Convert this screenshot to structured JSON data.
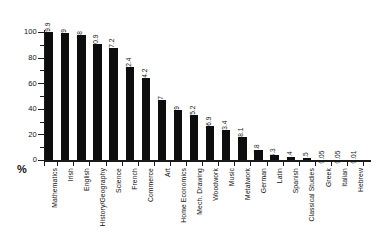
{
  "chart_data": {
    "type": "bar",
    "title": "",
    "subtitle": "",
    "xlabel": "",
    "ylabel": "%",
    "ylim": [
      0,
      100
    ],
    "ytick_values": [
      0,
      20,
      40,
      60,
      80,
      100
    ],
    "ytick_labels": [
      "0",
      "20",
      "40",
      "60",
      "80",
      "100"
    ],
    "yminor_values": [
      10,
      30,
      50,
      70,
      90
    ],
    "grid": false,
    "legend": null,
    "orientation": "vertical",
    "bar_color": "#0d0d0d",
    "background_color": "#ffffff",
    "axis_color": "#1a1a1a",
    "categories": [
      "Mathematics",
      "Irish",
      "English",
      "History/Geography",
      "Science",
      "French",
      "Commerce",
      "Art",
      "Home Economics",
      "Mech. Drawing",
      "Woodwork",
      "Music",
      "Metalwork",
      "German",
      "Latin",
      "Spanish",
      "Classical Studies",
      "Greek",
      "Italian",
      "Hebrew"
    ],
    "values": [
      99.9,
      99,
      98,
      90.9,
      87.2,
      72.4,
      64.2,
      47,
      39,
      35.2,
      26.9,
      23.4,
      18.1,
      7.8,
      4.3,
      2.4,
      1.5,
      0.05,
      0.05,
      0.01
    ],
    "value_labels": [
      "99.9",
      "99",
      "98",
      "90.9",
      "87.2",
      "72.4",
      "64.2",
      "47",
      "39",
      "35.2",
      "26.9",
      "23.4",
      "18.1",
      "7.8",
      "4.3",
      "2.4",
      "1.5",
      "0.05",
      "0.05",
      "0.01"
    ]
  },
  "axis": {
    "percent_symbol": "%"
  }
}
